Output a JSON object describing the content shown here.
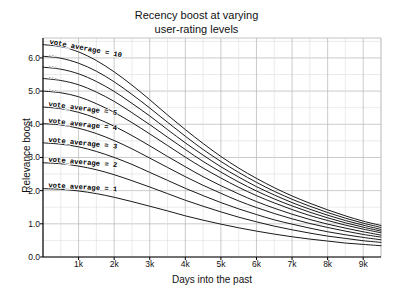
{
  "chart_data": {
    "type": "line",
    "title_line1": "Recency boost at varying",
    "title_line2": "user-rating levels",
    "xlabel": "Days into the past",
    "ylabel": "Relevance boost",
    "xlim": [
      0,
      9500
    ],
    "ylim": [
      0.0,
      6.6
    ],
    "grid": true,
    "grid_minor": true,
    "legend_position": "inline-curve-labels",
    "xticks": [
      1000,
      2000,
      3000,
      4000,
      5000,
      6000,
      7000,
      8000,
      9000
    ],
    "xticklabels": [
      "1k",
      "2k",
      "3k",
      "4k",
      "5k",
      "6k",
      "7k",
      "8k",
      "9k"
    ],
    "yticks": [
      0.0,
      1.0,
      2.0,
      3.0,
      4.0,
      5.0,
      6.0
    ],
    "yticklabels": [
      "0.0",
      "1.0",
      "2.0",
      "3.0",
      "4.0",
      "5.0",
      "6.0"
    ],
    "x": [
      0,
      500,
      1000,
      1500,
      2000,
      2500,
      3000,
      3500,
      4000,
      4500,
      5000,
      5500,
      6000,
      6500,
      7000,
      7500,
      8000,
      8500,
      9000,
      9500
    ],
    "series": [
      {
        "name": "vote_average = 10",
        "label": "vote_average = 10",
        "label_short": "vote_average = 10",
        "values": [
          6.4,
          6.34,
          6.18,
          5.92,
          5.58,
          5.18,
          4.74,
          4.28,
          3.84,
          3.42,
          3.03,
          2.68,
          2.37,
          2.09,
          1.84,
          1.62,
          1.42,
          1.24,
          1.08,
          0.95
        ]
      },
      {
        "name": "vote_average = 9",
        "label": "vote_average = 9",
        "label_short": "...",
        "values": [
          6.05,
          5.99,
          5.84,
          5.6,
          5.28,
          4.9,
          4.49,
          4.06,
          3.64,
          3.24,
          2.88,
          2.55,
          2.25,
          1.98,
          1.74,
          1.53,
          1.34,
          1.17,
          1.02,
          0.89
        ]
      },
      {
        "name": "vote_average = 8",
        "label": "vote_average = 8",
        "label_short": "...",
        "values": [
          5.72,
          5.66,
          5.52,
          5.29,
          4.99,
          4.63,
          4.25,
          3.84,
          3.44,
          3.07,
          2.72,
          2.41,
          2.12,
          1.87,
          1.64,
          1.44,
          1.26,
          1.1,
          0.96,
          0.83
        ]
      },
      {
        "name": "vote_average = 7",
        "label": "vote_average = 7",
        "label_short": "...",
        "values": [
          5.38,
          5.32,
          5.19,
          4.97,
          4.69,
          4.35,
          3.99,
          3.61,
          3.24,
          2.88,
          2.56,
          2.26,
          1.99,
          1.75,
          1.54,
          1.35,
          1.18,
          1.03,
          0.9,
          0.78
        ]
      },
      {
        "name": "vote_average = 6",
        "label": "vote_average = 6",
        "label_short": "...",
        "values": [
          5.0,
          4.95,
          4.83,
          4.62,
          4.36,
          4.05,
          3.71,
          3.36,
          3.01,
          2.68,
          2.38,
          2.1,
          1.85,
          1.63,
          1.43,
          1.25,
          1.1,
          0.96,
          0.84,
          0.73
        ]
      },
      {
        "name": "vote_average = 5",
        "label": "vote_average = 5",
        "label_short": "vote_average = 5",
        "values": [
          4.52,
          4.47,
          4.36,
          4.18,
          3.94,
          3.66,
          3.35,
          3.03,
          2.72,
          2.42,
          2.15,
          1.9,
          1.67,
          1.47,
          1.29,
          1.13,
          0.99,
          0.87,
          0.76,
          0.66
        ]
      },
      {
        "name": "vote_average = 4",
        "label": "vote_average = 4",
        "label_short": "vote_average = 4",
        "values": [
          4.02,
          3.98,
          3.88,
          3.72,
          3.51,
          3.26,
          2.98,
          2.7,
          2.42,
          2.16,
          1.92,
          1.69,
          1.49,
          1.31,
          1.15,
          1.01,
          0.89,
          0.78,
          0.68,
          0.6
        ]
      },
      {
        "name": "vote_average = 3",
        "label": "vote_average = 3",
        "label_short": "vote_average = 3",
        "values": [
          3.44,
          3.4,
          3.32,
          3.18,
          3.0,
          2.79,
          2.55,
          2.31,
          2.07,
          1.85,
          1.64,
          1.45,
          1.28,
          1.12,
          0.99,
          0.87,
          0.76,
          0.67,
          0.59,
          0.52
        ]
      },
      {
        "name": "vote_average = 2",
        "label": "vote_average = 2",
        "label_short": "vote_average = 2",
        "values": [
          2.84,
          2.81,
          2.74,
          2.63,
          2.48,
          2.3,
          2.11,
          1.91,
          1.71,
          1.53,
          1.36,
          1.2,
          1.06,
          0.93,
          0.82,
          0.72,
          0.63,
          0.56,
          0.49,
          0.44
        ]
      },
      {
        "name": "vote_average = 1",
        "label": "vote_average = 1",
        "label_short": "vote_average = 1",
        "values": [
          2.06,
          2.04,
          1.99,
          1.91,
          1.8,
          1.67,
          1.53,
          1.39,
          1.24,
          1.11,
          0.99,
          0.88,
          0.78,
          0.69,
          0.61,
          0.54,
          0.48,
          0.42,
          0.38,
          0.34
        ]
      }
    ],
    "colors": {
      "line": "#1a1a1a",
      "grid_major": "#b4b4b4",
      "grid_minor": "#dedede",
      "axis": "#000000",
      "background": "#ffffff",
      "text": "#111111"
    }
  }
}
